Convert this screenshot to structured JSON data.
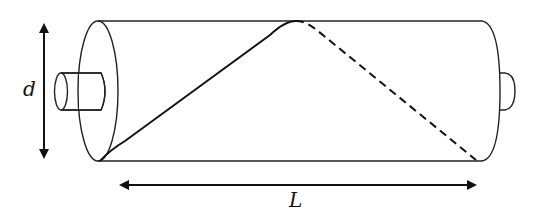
{
  "diagram": {
    "labels": {
      "diameter": "d",
      "length": "L"
    },
    "colors": {
      "stroke": "#222222",
      "background": "#ffffff"
    },
    "elements": [
      "cylinder-body",
      "left-end-face-ellipse",
      "right-end-cap",
      "left-shaft",
      "right-shaft-nub",
      "helix-front-solid",
      "helix-back-dashed",
      "diameter-arrow",
      "length-arrow"
    ]
  }
}
